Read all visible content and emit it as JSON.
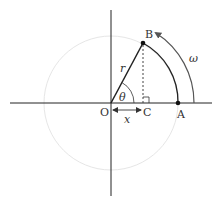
{
  "diagram": {
    "points": {
      "O": {
        "label": "O"
      },
      "A": {
        "label": "A"
      },
      "B": {
        "label": "B"
      },
      "C": {
        "label": "C"
      }
    },
    "labels": {
      "radius": "r",
      "angle": "θ",
      "projection": "x",
      "angular_velocity": "ω"
    },
    "colors": {
      "axis": "#222222",
      "circle": "#e4e4e4",
      "ink": "#222222",
      "arrow": "#555555"
    }
  }
}
